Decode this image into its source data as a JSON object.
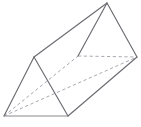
{
  "figure": {
    "name": "triangular-prism",
    "title": "Triangular prism wireframe diagram",
    "canvas": {
      "width": 141,
      "height": 127,
      "background": "#ffffff"
    },
    "style": {
      "visible_edge_color": "#6b6b72",
      "hidden_edge_color": "#a9a9b2",
      "base_edge_color": "#8a8a90",
      "visible_edge_width": 1.15,
      "hidden_edge_width": 1,
      "hidden_dash_pattern": "3.2 2.6",
      "face_fill": "#ffffff"
    },
    "vertices": {
      "front_bottom_left": {
        "label": "A",
        "x": 4,
        "y": 116
      },
      "front_apex": {
        "label": "B",
        "x": 34,
        "y": 57
      },
      "front_bottom_right": {
        "label": "C",
        "x": 68,
        "y": 116
      },
      "back_hidden": {
        "label": "D",
        "x": 78,
        "y": 56
      },
      "back_apex": {
        "label": "E",
        "x": 107,
        "y": 3
      },
      "back_right": {
        "label": "F",
        "x": 137,
        "y": 57
      }
    },
    "edges": [
      {
        "name": "front-left-slant",
        "from": "front_bottom_left",
        "to": "front_apex",
        "visibility": "visible"
      },
      {
        "name": "front-right-slant",
        "from": "front_apex",
        "to": "front_bottom_right",
        "visibility": "visible"
      },
      {
        "name": "front-base",
        "from": "front_bottom_left",
        "to": "front_bottom_right",
        "visibility": "visible"
      },
      {
        "name": "top-ridge",
        "from": "front_apex",
        "to": "back_apex",
        "visibility": "visible"
      },
      {
        "name": "lower-right-lateral",
        "from": "front_bottom_right",
        "to": "back_right",
        "visibility": "visible"
      },
      {
        "name": "back-left-slant",
        "from": "back_hidden",
        "to": "back_apex",
        "visibility": "visible"
      },
      {
        "name": "back-right-slant",
        "from": "back_apex",
        "to": "back_right",
        "visibility": "visible"
      },
      {
        "name": "hidden-back-base",
        "from": "back_hidden",
        "to": "back_right",
        "visibility": "hidden"
      },
      {
        "name": "hidden-lateral-left",
        "from": "front_bottom_left",
        "to": "back_hidden",
        "visibility": "hidden"
      },
      {
        "name": "hidden-long-diagonal",
        "from": "front_bottom_left",
        "to": "back_right",
        "visibility": "hidden"
      }
    ]
  }
}
